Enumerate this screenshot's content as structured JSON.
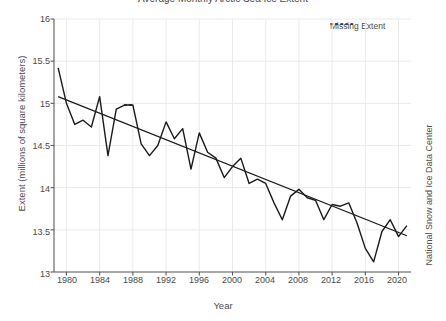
{
  "title": {
    "text": "Average Monthly Arctic Sea Ice Extent",
    "color": "#4a4a4a"
  },
  "axis": {
    "xlabel": "Year",
    "ylabel": "Extent (millions of square kilometers)",
    "right_label": "National Snow and Ice Data Center",
    "xticks": [
      "1980",
      "1984",
      "1988",
      "1992",
      "1996",
      "2000",
      "2004",
      "2008",
      "2012",
      "2016",
      "2020"
    ],
    "yticks": [
      "16",
      "15.5",
      "15",
      "14.5",
      "14",
      "13.5",
      "13"
    ],
    "xlim": [
      1978.5,
      2021.5
    ],
    "ylim": [
      13,
      16
    ],
    "grid": true,
    "grid_color": "#eaeaea",
    "axis_color": "#5a5a5a"
  },
  "legend": {
    "position": "top-right",
    "entries": [
      {
        "label": "Missing Extent",
        "style": "dotted",
        "color": "#1a1a1a"
      }
    ]
  },
  "colors": {
    "series_line": "#1a1a1a",
    "trend_line": "#1a1a1a",
    "background": "#ffffff"
  },
  "chart_data": {
    "type": "line",
    "title": "Average Monthly Arctic Sea Ice Extent",
    "xlabel": "Year",
    "ylabel": "Extent (millions of square kilometers)",
    "xlim": [
      1978.5,
      2021.5
    ],
    "ylim": [
      13,
      16
    ],
    "grid": true,
    "series": [
      {
        "name": "Extent",
        "style": "solid",
        "color": "#1a1a1a",
        "x": [
          1979,
          1980,
          1981,
          1982,
          1983,
          1984,
          1985,
          1986,
          1987,
          1988,
          1989,
          1990,
          1991,
          1992,
          1993,
          1994,
          1995,
          1996,
          1997,
          1998,
          1999,
          2000,
          2001,
          2002,
          2003,
          2004,
          2005,
          2006,
          2007,
          2008,
          2009,
          2010,
          2011,
          2012,
          2013,
          2014,
          2015,
          2016,
          2017,
          2018,
          2019,
          2020,
          2021
        ],
        "y": [
          15.42,
          15.0,
          14.75,
          14.8,
          14.72,
          15.08,
          14.38,
          14.93,
          14.98,
          14.98,
          14.52,
          14.38,
          14.5,
          14.78,
          14.58,
          14.7,
          14.22,
          14.65,
          14.42,
          14.35,
          14.12,
          14.25,
          14.35,
          14.05,
          14.1,
          14.05,
          13.82,
          13.62,
          13.9,
          13.98,
          13.88,
          13.85,
          13.62,
          13.8,
          13.78,
          13.82,
          13.58,
          13.28,
          13.12,
          13.48,
          13.62,
          13.42,
          13.55
        ]
      },
      {
        "name": "Missing Extent",
        "style": "dotted",
        "color": "#1a1a1a",
        "x": [
          1987,
          1988
        ],
        "y": [
          14.98,
          14.98
        ]
      },
      {
        "name": "Linear Trend",
        "style": "solid",
        "color": "#1a1a1a",
        "x": [
          1979,
          2021
        ],
        "y": [
          15.08,
          13.43
        ]
      }
    ],
    "annotations": [
      {
        "text": "National Snow and Ice Data Center",
        "position": "right-margin"
      }
    ]
  }
}
